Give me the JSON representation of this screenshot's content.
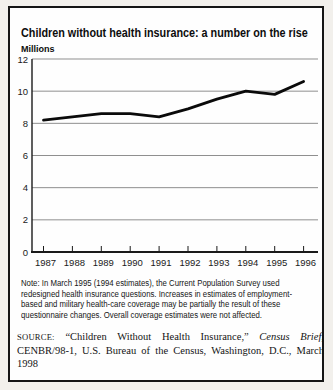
{
  "figure": {
    "caption_partial": "FIGURE 4.1"
  },
  "chart": {
    "title": "Children without health insurance: a number on the rise",
    "y_unit_label": "Millions"
  },
  "chart_data": {
    "type": "line",
    "title": "Children without health insurance: a number on the rise",
    "xlabel": "",
    "ylabel": "Millions",
    "x": [
      "1987",
      "1988",
      "1989",
      "1990",
      "1991",
      "1992",
      "1993",
      "1994",
      "1995",
      "1996"
    ],
    "series": [
      {
        "name": "Children without health insurance (millions)",
        "values": [
          8.2,
          8.4,
          8.6,
          8.6,
          8.4,
          8.9,
          9.5,
          10.0,
          9.8,
          10.6
        ]
      }
    ],
    "ylim": [
      0,
      12
    ],
    "ytick_step": 2,
    "grid": true,
    "legend": "none",
    "line_color": "#0a0a0a",
    "grid_color": "#8f8f8f",
    "axis_color": "#1a1a1a",
    "tick_label_color": "#1a1a1a"
  },
  "note": {
    "lines": [
      "Note: In March 1995 (1994 estimates), the Current Population Survey used",
      "redesigned health insurance questions. Increases in estimates of employment-",
      "based and military health-care coverage may be partially the result of these",
      "questionnaire changes. Overall coverage estimates were not affected."
    ]
  },
  "source": {
    "prefix": "SOURCE:",
    "before_italic": " “Children Without Health Insurance,” ",
    "italic": "Census Brief,",
    "after_italic": " CENBR/98-1, U.S. Bureau of the Census, Washington, D.C., March 1998"
  }
}
